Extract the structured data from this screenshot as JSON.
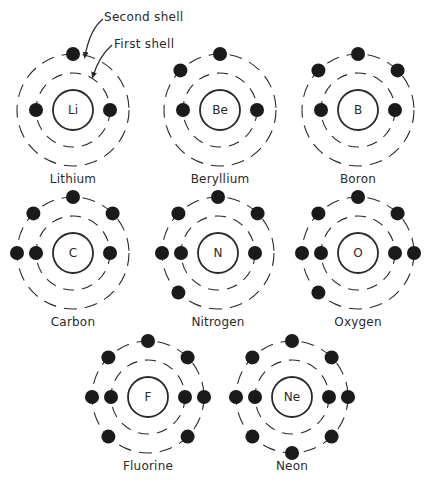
{
  "diagram": {
    "callouts": [
      {
        "label": "Second shell",
        "x": 104,
        "y": 10
      },
      {
        "label": "First shell",
        "x": 114,
        "y": 37
      }
    ],
    "style": {
      "line_color": "#2a2a2a",
      "electron_color": "#1a1a1a",
      "nucleus_radius": 20,
      "inner_shell_radius": 37,
      "outer_shell_radius": 56,
      "electron_radius": 7
    },
    "atoms": [
      {
        "name": "Lithium",
        "symbol": "Li",
        "cx": 73,
        "cy": 110,
        "inner": [
          "left",
          "right"
        ],
        "outer": [
          "top"
        ]
      },
      {
        "name": "Beryllium",
        "symbol": "Be",
        "cx": 220,
        "cy": 110,
        "inner": [
          "left",
          "right"
        ],
        "outer": [
          "top",
          "top-left"
        ]
      },
      {
        "name": "Boron",
        "symbol": "B",
        "cx": 358,
        "cy": 110,
        "inner": [
          "left",
          "right"
        ],
        "outer": [
          "top",
          "top-left",
          "top-right"
        ]
      },
      {
        "name": "Carbon",
        "symbol": "C",
        "cx": 73,
        "cy": 253,
        "inner": [
          "left",
          "right"
        ],
        "outer": [
          "top",
          "top-left",
          "top-right",
          "left"
        ]
      },
      {
        "name": "Nitrogen",
        "symbol": "N",
        "cx": 218,
        "cy": 253,
        "inner": [
          "left",
          "right"
        ],
        "outer": [
          "top",
          "top-left",
          "top-right",
          "left",
          "bottom-left"
        ]
      },
      {
        "name": "Oxygen",
        "symbol": "O",
        "cx": 358,
        "cy": 253,
        "inner": [
          "left",
          "right"
        ],
        "outer": [
          "top",
          "top-left",
          "top-right",
          "left",
          "right",
          "bottom-left"
        ]
      },
      {
        "name": "Fluorine",
        "symbol": "F",
        "cx": 148,
        "cy": 397,
        "inner": [
          "left",
          "right"
        ],
        "outer": [
          "top",
          "top-left",
          "top-right",
          "left",
          "right",
          "bottom-left",
          "bottom-right"
        ]
      },
      {
        "name": "Neon",
        "symbol": "Ne",
        "cx": 292,
        "cy": 397,
        "inner": [
          "left",
          "right"
        ],
        "outer": [
          "top",
          "top-left",
          "top-right",
          "left",
          "right",
          "bottom-left",
          "bottom-right",
          "bottom"
        ]
      }
    ]
  }
}
